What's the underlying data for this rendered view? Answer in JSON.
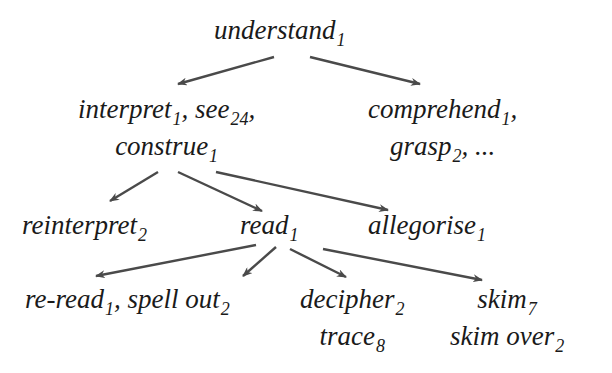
{
  "diagram": {
    "type": "tree",
    "arrow_color": "#4a4a4a",
    "nodes": {
      "understand": {
        "lines": [
          [
            {
              "w": "understand",
              "s": "1"
            }
          ]
        ]
      },
      "interpret": {
        "lines": [
          [
            {
              "w": "interpret",
              "s": "1"
            },
            {
              "t": ", "
            },
            {
              "w": "see",
              "s": "24"
            },
            {
              "t": ","
            }
          ],
          [
            {
              "w": "construe",
              "s": "1"
            }
          ]
        ]
      },
      "comprehend": {
        "lines": [
          [
            {
              "w": "comprehend",
              "s": "1"
            },
            {
              "t": ","
            }
          ],
          [
            {
              "w": "grasp",
              "s": "2"
            },
            {
              "t": ", ..."
            }
          ]
        ]
      },
      "reinterpret": {
        "lines": [
          [
            {
              "w": "reinterpret",
              "s": "2"
            }
          ]
        ]
      },
      "read": {
        "lines": [
          [
            {
              "w": "read",
              "s": "1"
            }
          ]
        ]
      },
      "allegorise": {
        "lines": [
          [
            {
              "w": "allegorise",
              "s": "1"
            }
          ]
        ]
      },
      "reread": {
        "lines": [
          [
            {
              "w": "re-read",
              "s": "1"
            },
            {
              "t": ", "
            },
            {
              "w": "spell out",
              "s": "2"
            }
          ]
        ]
      },
      "decipher": {
        "lines": [
          [
            {
              "w": "decipher",
              "s": "2"
            }
          ],
          [
            {
              "w": "trace",
              "s": "8"
            }
          ]
        ]
      },
      "skim": {
        "lines": [
          [
            {
              "w": "skim",
              "s": "7"
            }
          ],
          [
            {
              "w": "skim over",
              "s": "2"
            }
          ]
        ]
      }
    },
    "edges": [
      {
        "from": "understand",
        "to": "interpret"
      },
      {
        "from": "understand",
        "to": "comprehend"
      },
      {
        "from": "interpret",
        "to": "reinterpret"
      },
      {
        "from": "interpret",
        "to": "read"
      },
      {
        "from": "interpret",
        "to": "allegorise"
      },
      {
        "from": "read",
        "to": "reread"
      },
      {
        "from": "read",
        "to": "spell out"
      },
      {
        "from": "read",
        "to": "decipher"
      },
      {
        "from": "read",
        "to": "skim"
      }
    ]
  }
}
